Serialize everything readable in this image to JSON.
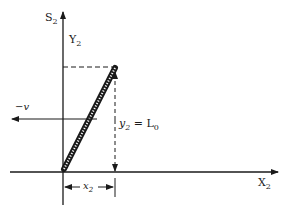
{
  "diagram": {
    "axes": {
      "vertical_label": "S",
      "vertical_sub": "2",
      "y_label": "Y",
      "y_sub": "2",
      "horizontal_label": "X",
      "horizontal_sub": "2"
    },
    "velocity_label": "−v",
    "height_label_var": "y",
    "height_label_sub": "2",
    "height_label_eq": " = L",
    "height_label_eq_sub": "0",
    "offset_label_var": "x",
    "offset_label_sub": "2",
    "colors": {
      "ink": "#1a1a1a",
      "background": "#ffffff"
    }
  }
}
